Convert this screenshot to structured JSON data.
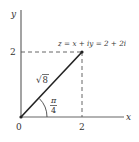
{
  "diagram": {
    "type": "complex-plane",
    "axes": {
      "x_label": "x",
      "y_label": "y",
      "origin_label": "0",
      "x_tick_label": "2",
      "y_tick_label": "2"
    },
    "point": {
      "equation": "z = x + iy = 2 + 2i",
      "x": 2,
      "y": 2
    },
    "modulus_label_radical": "√",
    "modulus_label_value": "8",
    "angle": {
      "numerator": "π",
      "denominator": "4"
    },
    "colors": {
      "line": "#333333",
      "axis": "#555555",
      "text": "#333333"
    }
  }
}
